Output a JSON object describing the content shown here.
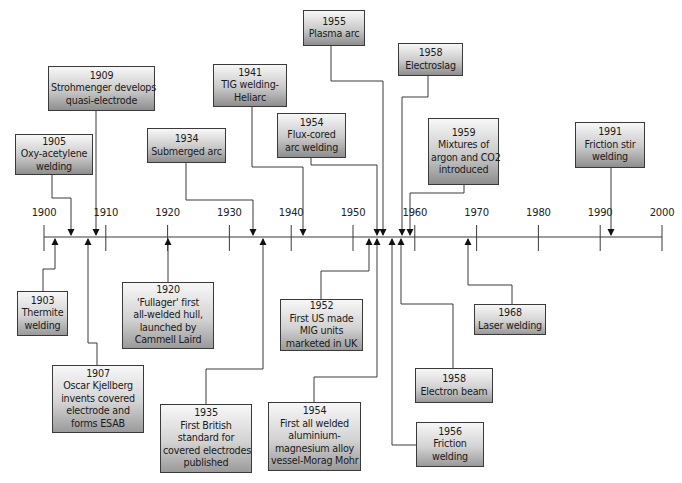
{
  "axis": {
    "start": 1900,
    "end": 2000,
    "ticks": [
      1900,
      1910,
      1920,
      1930,
      1940,
      1950,
      1960,
      1970,
      1980,
      1990,
      2000
    ],
    "tick_labels": [
      "1900",
      "1910",
      "1920",
      "1930",
      "1940",
      "1950",
      "1960",
      "1970",
      "1980",
      "1990",
      "2000"
    ]
  },
  "events_above": [
    {
      "year": "1905",
      "lines": [
        "1905",
        "Oxy-acetylene",
        "welding"
      ],
      "box": {
        "x": 15,
        "y": 134,
        "w": 78,
        "h": 41
      },
      "arrow_year": 1905,
      "route": [
        [
          52,
          175
        ],
        [
          52,
          198
        ],
        [
          71,
          198
        ],
        [
          71,
          235
        ]
      ]
    },
    {
      "year": "1909",
      "lines": [
        "1909",
        "Strohmenger develops",
        "quasi-electrode"
      ],
      "box": {
        "x": 48,
        "y": 66,
        "w": 107,
        "h": 45
      },
      "arrow_year": 1908.4,
      "route": [
        [
          96,
          111
        ],
        [
          96,
          235
        ]
      ]
    },
    {
      "year": "1934",
      "lines": [
        "1934",
        "Submerged arc"
      ],
      "box": {
        "x": 147,
        "y": 128,
        "w": 79,
        "h": 35
      },
      "arrow_year": 1934,
      "route": [
        [
          186,
          163
        ],
        [
          186,
          200
        ],
        [
          253,
          200
        ],
        [
          253,
          235
        ]
      ]
    },
    {
      "year": "1941",
      "lines": [
        "1941",
        "TIG welding-",
        "Heliarc"
      ],
      "box": {
        "x": 213,
        "y": 64,
        "w": 74,
        "h": 43
      },
      "arrow_year": 1941.5,
      "route": [
        [
          252,
          107
        ],
        [
          252,
          167
        ],
        [
          303,
          167
        ],
        [
          303,
          235
        ]
      ]
    },
    {
      "year": "1954",
      "lines": [
        "1954",
        "Flux-cored",
        "arc welding"
      ],
      "box": {
        "x": 277,
        "y": 113,
        "w": 69,
        "h": 45
      },
      "arrow_year": 1953.6,
      "route": [
        [
          311,
          158
        ],
        [
          311,
          165
        ],
        [
          377,
          165
        ],
        [
          377,
          235
        ]
      ]
    },
    {
      "year": "1955",
      "lines": [
        "1955",
        "Plasma arc"
      ],
      "box": {
        "x": 303,
        "y": 10,
        "w": 62,
        "h": 36
      },
      "arrow_year": 1954.3,
      "route": [
        [
          331,
          46
        ],
        [
          331,
          81
        ],
        [
          383,
          81
        ],
        [
          383,
          235
        ]
      ]
    },
    {
      "year": "1958",
      "lines": [
        "1958",
        "Electroslag"
      ],
      "box": {
        "x": 398,
        "y": 43,
        "w": 65,
        "h": 33
      },
      "arrow_year": 1957.6,
      "route": [
        [
          428,
          76
        ],
        [
          428,
          97
        ],
        [
          402,
          97
        ],
        [
          402,
          235
        ]
      ]
    },
    {
      "year": "1959",
      "lines": [
        "1959",
        "Mixtures of",
        "argon and CO2",
        "introduced"
      ],
      "box": {
        "x": 428,
        "y": 118,
        "w": 71,
        "h": 67
      },
      "arrow_year": 1958.8,
      "route": [
        [
          464,
          185
        ],
        [
          464,
          193
        ],
        [
          410,
          193
        ],
        [
          410,
          235
        ]
      ]
    },
    {
      "year": "1991",
      "lines": [
        "1991",
        "Friction stir",
        "welding"
      ],
      "box": {
        "x": 575,
        "y": 122,
        "w": 70,
        "h": 46
      },
      "arrow_year": 1991.3,
      "route": [
        [
          611,
          168
        ],
        [
          611,
          235
        ]
      ]
    }
  ],
  "events_below": [
    {
      "year": "1903",
      "lines": [
        "1903",
        "Thermite",
        "welding"
      ],
      "box": {
        "x": 17,
        "y": 291,
        "w": 51,
        "h": 45
      },
      "arrow_year": 1903,
      "route": [
        [
          43,
          291
        ],
        [
          43,
          269
        ],
        [
          55,
          269
        ],
        [
          55,
          239
        ]
      ]
    },
    {
      "year": "1907",
      "lines": [
        "1907",
        "Oscar Kjellberg",
        "invents covered",
        "electrode and",
        "forms ESAB"
      ],
      "box": {
        "x": 52,
        "y": 365,
        "w": 92,
        "h": 68
      },
      "arrow_year": 1906.9,
      "route": [
        [
          97,
          365
        ],
        [
          97,
          343
        ],
        [
          88,
          343
        ],
        [
          88,
          239
        ]
      ]
    },
    {
      "year": "1920",
      "lines": [
        "1920",
        "'Fullager' first",
        "all-welded hull,",
        "launched by",
        "Cammell Laird"
      ],
      "box": {
        "x": 122,
        "y": 282,
        "w": 92,
        "h": 67
      },
      "arrow_year": 1920,
      "route": [
        [
          168,
          282
        ],
        [
          168,
          239
        ]
      ]
    },
    {
      "year": "1935",
      "lines": [
        "1935",
        "First British",
        "standard for",
        "covered electrodes",
        "published"
      ],
      "box": {
        "x": 160,
        "y": 404,
        "w": 92,
        "h": 69
      },
      "arrow_year": 1935,
      "route": [
        [
          206,
          404
        ],
        [
          206,
          369
        ],
        [
          263,
          369
        ],
        [
          263,
          239
        ]
      ]
    },
    {
      "year": "1952",
      "lines": [
        "1952",
        "First US made",
        "MIG units",
        "marketed in UK"
      ],
      "box": {
        "x": 280,
        "y": 299,
        "w": 83,
        "h": 52
      },
      "arrow_year": 1952.4,
      "route": [
        [
          321,
          299
        ],
        [
          321,
          271
        ],
        [
          369,
          271
        ],
        [
          369,
          239
        ]
      ]
    },
    {
      "year": "1954",
      "lines": [
        "1954",
        "First all welded",
        "aluminium-",
        "magnesium alloy",
        "vessel-Morag Mohr"
      ],
      "box": {
        "x": 268,
        "y": 402,
        "w": 93,
        "h": 69
      },
      "arrow_year": 1953.8,
      "route": [
        [
          314,
          402
        ],
        [
          314,
          377
        ],
        [
          377,
          377
        ],
        [
          377,
          239
        ]
      ]
    },
    {
      "year": "1956",
      "lines": [
        "1956",
        "Friction",
        "welding"
      ],
      "box": {
        "x": 416,
        "y": 422,
        "w": 68,
        "h": 45
      },
      "arrow_year": 1955.9,
      "route": [
        [
          416,
          445
        ],
        [
          392,
          445
        ],
        [
          392,
          239
        ]
      ]
    },
    {
      "year": "1958",
      "lines": [
        "1958",
        "Electron beam"
      ],
      "box": {
        "x": 415,
        "y": 368,
        "w": 78,
        "h": 35
      },
      "arrow_year": 1957.5,
      "route": [
        [
          453,
          368
        ],
        [
          453,
          304
        ],
        [
          401,
          304
        ],
        [
          401,
          239
        ]
      ]
    },
    {
      "year": "1968",
      "lines": [
        "1968",
        "Laser welding"
      ],
      "box": {
        "x": 474,
        "y": 304,
        "w": 72,
        "h": 31
      },
      "arrow_year": 1968.6,
      "route": [
        [
          512,
          304
        ],
        [
          512,
          285
        ],
        [
          468,
          285
        ],
        [
          468,
          239
        ]
      ]
    }
  ],
  "colors": {
    "line": "#3a3a3a",
    "box_top": "#f7f7f7",
    "box_bottom": "#8e8e8e",
    "text": "#1a1a1a"
  }
}
